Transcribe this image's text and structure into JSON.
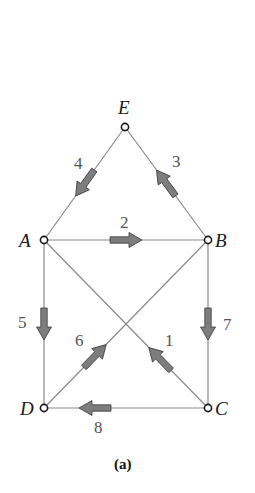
{
  "figure": {
    "caption": "(a)",
    "colors": {
      "edge": "#8a8a8a",
      "node_stroke": "#1a1a1a",
      "arrow_fill": "#7d7d7d",
      "label": "#555555"
    },
    "nodes": [
      {
        "id": "E",
        "label": "E",
        "x": 125,
        "y": 127
      },
      {
        "id": "A",
        "label": "A",
        "x": 44,
        "y": 240
      },
      {
        "id": "B",
        "label": "B",
        "x": 208,
        "y": 240
      },
      {
        "id": "D",
        "label": "D",
        "x": 44,
        "y": 408
      },
      {
        "id": "C",
        "label": "C",
        "x": 208,
        "y": 408
      }
    ],
    "edges": [
      {
        "id": "1",
        "label": "1",
        "from": "C",
        "to": "A",
        "arrow_direction": "toward A"
      },
      {
        "id": "2",
        "label": "2",
        "from": "A",
        "to": "B",
        "arrow_direction": "toward B"
      },
      {
        "id": "3",
        "label": "3",
        "from": "B",
        "to": "E",
        "arrow_direction": "toward E"
      },
      {
        "id": "4",
        "label": "4",
        "from": "E",
        "to": "A",
        "arrow_direction": "toward A"
      },
      {
        "id": "5",
        "label": "5",
        "from": "A",
        "to": "D",
        "arrow_direction": "toward D"
      },
      {
        "id": "6",
        "label": "6",
        "from": "D",
        "to": "B",
        "arrow_direction": "toward B"
      },
      {
        "id": "7",
        "label": "7",
        "from": "B",
        "to": "C",
        "arrow_direction": "toward C"
      },
      {
        "id": "8",
        "label": "8",
        "from": "C",
        "to": "D",
        "arrow_direction": "toward D"
      }
    ]
  }
}
